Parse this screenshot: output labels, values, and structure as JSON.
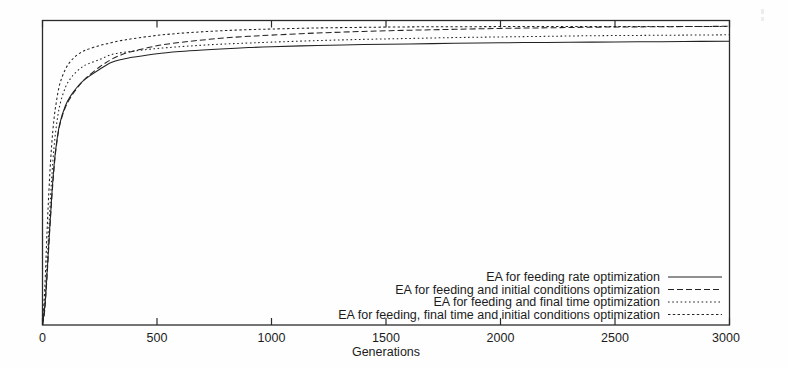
{
  "chart_data": {
    "type": "line",
    "title": "",
    "subtitle": "",
    "xlabel": "Generations",
    "ylabel": "",
    "xlim": [
      0,
      3000
    ],
    "ylim": [
      0,
      1
    ],
    "grid": false,
    "legend_position": "bottom-right",
    "xticks": [
      0,
      500,
      1000,
      1500,
      2000,
      2500,
      3000
    ],
    "xtick_labels": [
      "0",
      "500",
      "1000",
      "1500",
      "2000",
      "2500",
      "3000"
    ],
    "yticks": [],
    "ytick_labels": [],
    "x": [
      0,
      10,
      20,
      30,
      40,
      50,
      60,
      75,
      100,
      125,
      150,
      175,
      200,
      250,
      300,
      350,
      400,
      500,
      600,
      700,
      800,
      900,
      1000,
      1200,
      1400,
      1600,
      1800,
      2000,
      2200,
      2400,
      2600,
      2800,
      3000
    ],
    "series": [
      {
        "name": "EA for feeding rate optimization",
        "style": "solid",
        "values": [
          0.0,
          0.06,
          0.17,
          0.3,
          0.42,
          0.52,
          0.59,
          0.66,
          0.72,
          0.755,
          0.78,
          0.8,
          0.815,
          0.84,
          0.862,
          0.873,
          0.88,
          0.891,
          0.898,
          0.903,
          0.907,
          0.911,
          0.914,
          0.918,
          0.921,
          0.923,
          0.925,
          0.927,
          0.928,
          0.929,
          0.93,
          0.931,
          0.932
        ]
      },
      {
        "name": "EA for feeding and initial conditions optimization",
        "style": "dashed",
        "values": [
          0.0,
          0.05,
          0.16,
          0.29,
          0.41,
          0.51,
          0.585,
          0.655,
          0.715,
          0.75,
          0.777,
          0.8,
          0.818,
          0.848,
          0.872,
          0.889,
          0.9,
          0.917,
          0.928,
          0.936,
          0.943,
          0.948,
          0.952,
          0.959,
          0.964,
          0.968,
          0.971,
          0.974,
          0.976,
          0.978,
          0.979,
          0.98,
          0.981
        ]
      },
      {
        "name": "EA for feeding and final time optimization",
        "style": "fine-dotted",
        "values": [
          0.0,
          0.07,
          0.2,
          0.35,
          0.48,
          0.58,
          0.65,
          0.72,
          0.78,
          0.812,
          0.833,
          0.848,
          0.858,
          0.872,
          0.888,
          0.895,
          0.9,
          0.908,
          0.914,
          0.919,
          0.923,
          0.926,
          0.929,
          0.934,
          0.938,
          0.941,
          0.944,
          0.946,
          0.948,
          0.95,
          0.951,
          0.952,
          0.953
        ]
      },
      {
        "name": "EA for feeding, final time and initial conditions optimization",
        "style": "dotted",
        "values": [
          0.0,
          0.12,
          0.31,
          0.47,
          0.59,
          0.675,
          0.73,
          0.79,
          0.84,
          0.868,
          0.886,
          0.898,
          0.906,
          0.918,
          0.927,
          0.935,
          0.941,
          0.951,
          0.958,
          0.963,
          0.967,
          0.97,
          0.972,
          0.9755,
          0.9775,
          0.979,
          0.9795,
          0.98,
          0.98,
          0.98,
          0.98,
          0.98,
          0.98
        ]
      }
    ]
  },
  "axis": {
    "x_title": "Generations"
  },
  "legend": {
    "entries": [
      {
        "label": "EA for feeding rate optimization",
        "style": "solid"
      },
      {
        "label": "EA for feeding and initial conditions optimization",
        "style": "dashed"
      },
      {
        "label": "EA for feeding and final time optimization",
        "style": "fine-dotted"
      },
      {
        "label": "EA for feeding, final time and initial conditions optimization",
        "style": "dotted"
      }
    ]
  },
  "colors": {
    "ink": "#222222",
    "frame": "#2a2a2a",
    "background": "#fefefe"
  }
}
